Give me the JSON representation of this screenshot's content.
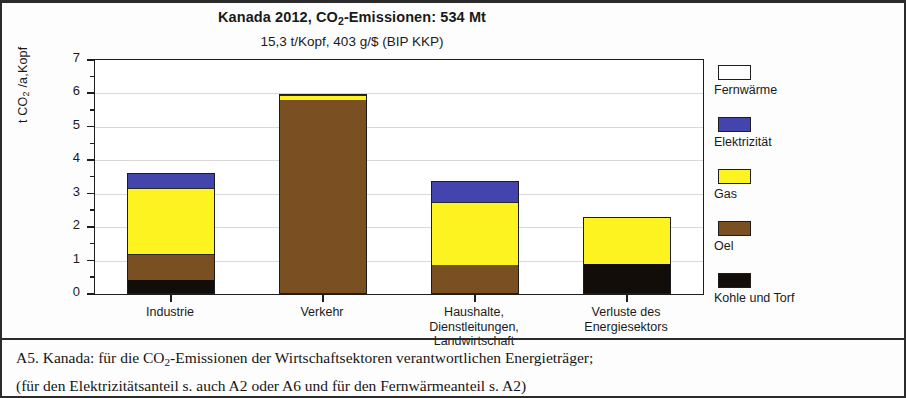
{
  "chart_data": {
    "type": "bar",
    "subtype": "stacked-bar",
    "title": "Kanada 2012,  CO2-Emissionen:  534 Mt",
    "title_parts": {
      "pre": "Kanada 2012,  CO",
      "sub": "2",
      "post": "-Emissionen:  534 Mt"
    },
    "subtitle": "15,3 t/Kopf,    403 g/$  (BIP KKP)",
    "xlabel": "",
    "ylabel": "t CO2 /a,Kopf",
    "ylabel_parts": {
      "pre": "t CO",
      "sub": "2",
      "post": " /a,Kopf"
    },
    "ylim": [
      0,
      7
    ],
    "ytick_labels": [
      "0",
      "1",
      "2",
      "3",
      "4",
      "5",
      "6",
      "7"
    ],
    "ytick_values": [
      0,
      1,
      2,
      3,
      4,
      5,
      6,
      7
    ],
    "minor_tick_step": 0.5,
    "grid": true,
    "grid_axis": "y",
    "legend_position": "right",
    "categories": [
      "Industrie",
      "Verkehr",
      "Haushalte, Dienstleitungen, Landwirtschaft",
      "Verluste des Energiesektors"
    ],
    "category_label_lines": [
      [
        "Industrie"
      ],
      [
        "Verkehr"
      ],
      [
        "Haushalte,",
        "Dienstleitungen,",
        "Landwirtschaft"
      ],
      [
        "Verluste des",
        "Energiesektors"
      ]
    ],
    "series": [
      {
        "name": "Kohle und Torf",
        "color": "#120d08",
        "values": [
          0.42,
          0.0,
          0.0,
          0.91
        ]
      },
      {
        "name": "Oel",
        "color": "#7a4f22",
        "values": [
          0.77,
          5.8,
          0.87,
          0.0
        ]
      },
      {
        "name": "Gas",
        "color": "#fcf320",
        "values": [
          2.0,
          0.17,
          1.9,
          1.39
        ]
      },
      {
        "name": "Elektrizität",
        "color": "#4444ad",
        "values": [
          0.44,
          0.0,
          0.62,
          0.0
        ]
      },
      {
        "name": "Fernwärme",
        "color": "#ffffff",
        "values": [
          0.0,
          0.0,
          0.0,
          0.0
        ]
      }
    ],
    "stack_order_bottom_to_top": [
      "Kohle und Torf",
      "Oel",
      "Gas",
      "Elektrizität",
      "Fernwärme"
    ],
    "totals": [
      3.63,
      5.97,
      3.39,
      2.3
    ]
  },
  "legend": {
    "items": [
      {
        "label": "Fernwärme",
        "color": "#ffffff"
      },
      {
        "label": "Elektrizität",
        "color": "#4444ad"
      },
      {
        "label": "Gas",
        "color": "#fcf320"
      },
      {
        "label": "Oel",
        "color": "#7a4f22"
      },
      {
        "label": "Kohle und Torf",
        "color": "#120d08"
      }
    ]
  },
  "caption": {
    "line1_pre": "A5.  Kanada:  für die CO",
    "line1_sub": "2",
    "line1_post": "-Emissionen der Wirtschaftsektoren verantwortlichen Energieträger;",
    "line2": "(für den Elektrizitätsanteil s. auch A2 oder A6 und für den Fernwärmeanteil s. A2)"
  }
}
